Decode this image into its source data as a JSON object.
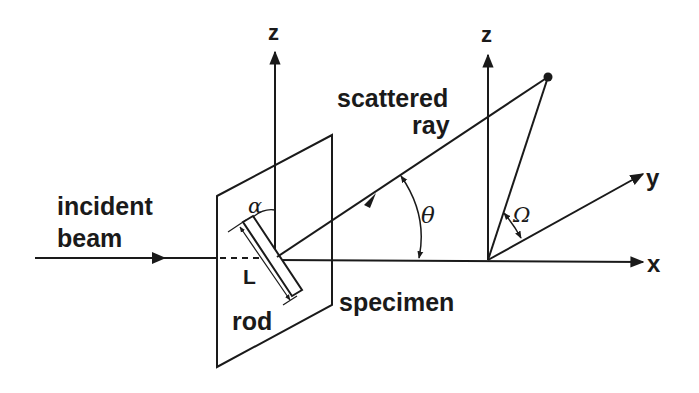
{
  "diagram": {
    "title": "",
    "labels": {
      "incident_beam_line1": "incident",
      "incident_beam_line2": "beam",
      "scattered_ray_line1": "scattered",
      "scattered_ray_line2": "ray",
      "specimen": "specimen",
      "rod": "rod",
      "length": "L",
      "alpha": "α",
      "theta": "θ",
      "omega": "Ω",
      "axis_z_left": "z",
      "axis_z_right": "z",
      "axis_x": "x",
      "axis_y": "y"
    },
    "colors": {
      "ink": "#1a1a1a",
      "background": "#ffffff"
    }
  }
}
